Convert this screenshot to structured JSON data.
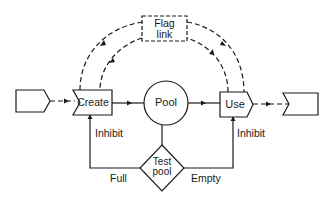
{
  "diagram": {
    "colors": {
      "stroke": "#1a1a1a",
      "background": "#ffffff"
    },
    "nodes": {
      "source": {
        "label": "",
        "shape": "pentagon-arrow"
      },
      "create": {
        "label": "Create",
        "shape": "notched-rectangle"
      },
      "pool": {
        "label": "Pool",
        "shape": "circle"
      },
      "use": {
        "label": "Use",
        "shape": "pentagon-arrow"
      },
      "sink": {
        "label": "",
        "shape": "notched-rectangle"
      },
      "flag_link": {
        "label_line1": "Flag",
        "label_line2": "link",
        "shape": "dashed-rectangle"
      },
      "test_pool": {
        "label_line1": "Test",
        "label_line2": "pool",
        "shape": "diamond"
      }
    },
    "edge_labels": {
      "inhibit_create": "Inhibit",
      "inhibit_use": "Inhibit",
      "full": "Full",
      "empty": "Empty"
    },
    "edges": [
      {
        "from": "source",
        "to": "create",
        "style": "dashed"
      },
      {
        "from": "create",
        "to": "pool",
        "style": "solid"
      },
      {
        "from": "pool",
        "to": "use",
        "style": "solid"
      },
      {
        "from": "use",
        "to": "sink",
        "style": "dashed"
      },
      {
        "from": "create",
        "to": "flag_link",
        "style": "dashed"
      },
      {
        "from": "flag_link",
        "to": "use",
        "style": "dashed"
      },
      {
        "from": "use",
        "to": "flag_link",
        "style": "dashed"
      },
      {
        "from": "flag_link",
        "to": "create",
        "style": "dashed"
      },
      {
        "from": "pool",
        "to": "test_pool",
        "style": "solid"
      },
      {
        "from": "test_pool",
        "to": "create",
        "style": "solid",
        "label": "Full / Inhibit"
      },
      {
        "from": "test_pool",
        "to": "use",
        "style": "solid",
        "label": "Empty / Inhibit"
      }
    ]
  }
}
